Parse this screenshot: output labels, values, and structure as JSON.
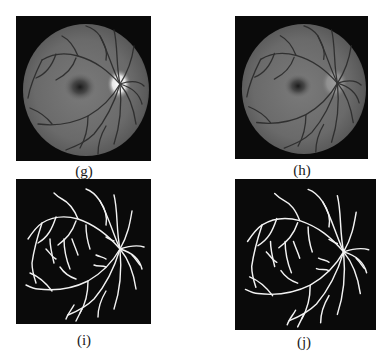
{
  "figure": {
    "panels": [
      {
        "id": "g",
        "caption": "(g)",
        "content": "retinal fundus image (grayscale, bright optic disc)"
      },
      {
        "id": "h",
        "caption": "(h)",
        "content": "retinal fundus image (grayscale, preprocessed, optic disc suppressed)"
      },
      {
        "id": "i",
        "caption": "(i)",
        "content": "binary vessel segmentation map"
      },
      {
        "id": "j",
        "caption": "(j)",
        "content": "binary vessel segmentation map"
      }
    ]
  },
  "colors": {
    "background": "#ffffff",
    "panel_background": "#0a0a0a",
    "vessel_segmentation": "#f2f2f2",
    "caption_text": "#1a1a1a"
  }
}
